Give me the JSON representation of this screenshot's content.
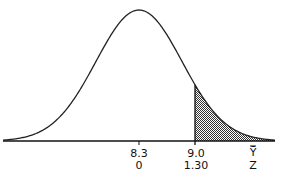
{
  "chart_data": {
    "type": "area",
    "title": "",
    "distribution": {
      "mean": 8.3,
      "z_cutoff": 1.3,
      "cutoff_value": 9.0
    },
    "x_axis": {
      "variable_label": "Ȳ",
      "z_label": "Z",
      "ticks": [
        {
          "value": "8.3",
          "z": "0"
        },
        {
          "value": "9.0",
          "z": "1.30"
        }
      ]
    },
    "shaded_region": {
      "from_z": 1.3,
      "to": "+infinity",
      "fill": "stippled gray"
    },
    "grid": false,
    "legend": null
  },
  "labels": {
    "mean_value": "8.3",
    "mean_z": "0",
    "cut_value": "9.0",
    "cut_z": "1.30",
    "var_label": "Ȳ",
    "z_label": "Z"
  },
  "colors": {
    "line": "#222222",
    "shade": "#777777",
    "background": "#ffffff"
  }
}
